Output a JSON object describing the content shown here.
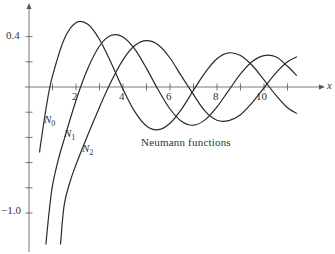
{
  "chart_data": {
    "type": "line",
    "title": "",
    "annotation": "Neumann functions",
    "xlabel": "x",
    "ylabel": "",
    "xlim": [
      0,
      12.3
    ],
    "ylim": [
      -1.25,
      0.65
    ],
    "x_ticks": [
      1,
      2,
      3,
      4,
      5,
      6,
      7,
      8,
      9,
      10,
      11
    ],
    "x_tick_labels": {
      "2": "2",
      "4": "4",
      "6": "6",
      "8": "8",
      "10": "10"
    },
    "y_ticks": [
      0.4,
      0.2,
      -0.2,
      -0.4,
      -0.6,
      -0.8,
      -1.0
    ],
    "y_tick_labels": {
      "0.4": "0.4",
      "-1.0": "−1.0"
    },
    "grid": false,
    "legend": "inline labels",
    "series": [
      {
        "name": "N0",
        "label_main": "N",
        "label_sub": "0",
        "x": [
          0.45,
          0.5,
          0.8,
          1,
          1.5,
          2,
          2.5,
          3,
          3.5,
          4,
          4.5,
          5,
          5.5,
          6,
          6.5,
          7,
          7.5,
          8,
          8.5,
          9,
          9.5,
          10,
          10.5,
          11,
          11.4
        ],
        "values": [
          -0.52,
          -0.445,
          -0.087,
          0.088,
          0.382,
          0.51,
          0.498,
          0.377,
          0.189,
          -0.017,
          -0.195,
          -0.309,
          -0.339,
          -0.288,
          -0.173,
          -0.026,
          0.117,
          0.224,
          0.271,
          0.25,
          0.171,
          0.056,
          -0.064,
          -0.164,
          -0.21
        ]
      },
      {
        "name": "N1",
        "label_main": "N",
        "label_sub": "1",
        "x": [
          0.72,
          0.85,
          1,
          1.25,
          1.5,
          2,
          2.5,
          3,
          3.5,
          4,
          4.5,
          5,
          5.5,
          6,
          6.5,
          7,
          7.5,
          8,
          8.5,
          9,
          9.5,
          10,
          10.5,
          11,
          11.4
        ],
        "values": [
          -1.25,
          -1.0,
          -0.781,
          -0.575,
          -0.412,
          -0.107,
          0.146,
          0.325,
          0.41,
          0.398,
          0.301,
          0.148,
          -0.024,
          -0.175,
          -0.274,
          -0.303,
          -0.259,
          -0.158,
          -0.026,
          0.104,
          0.202,
          0.249,
          0.24,
          0.164,
          0.09
        ]
      },
      {
        "name": "N2",
        "label_main": "N",
        "label_sub": "2",
        "x": [
          1.34,
          1.5,
          1.75,
          2,
          2.5,
          3,
          3.5,
          4,
          4.5,
          5,
          5.5,
          6,
          6.5,
          7,
          7.5,
          8,
          8.5,
          9,
          9.5,
          10,
          10.5,
          11,
          11.4
        ],
        "values": [
          -1.25,
          -0.932,
          -0.75,
          -0.617,
          -0.381,
          -0.16,
          0.045,
          0.216,
          0.329,
          0.368,
          0.334,
          0.23,
          0.082,
          -0.06,
          -0.194,
          -0.264,
          -0.267,
          -0.22,
          -0.124,
          -0.006,
          0.11,
          0.2,
          0.24
        ]
      }
    ]
  },
  "labels": {
    "axis_x": "x",
    "annotation": "Neumann functions",
    "y_04": "0.4",
    "y_m10": "−1.0",
    "x2": "2",
    "x4": "4",
    "x6": "6",
    "x8": "8",
    "x10": "10",
    "n": "N",
    "s0": "0",
    "s1": "1",
    "s2": "2"
  },
  "colors": {
    "curve": "#2a2a2a",
    "axis": "#555555",
    "text": "#333333"
  }
}
